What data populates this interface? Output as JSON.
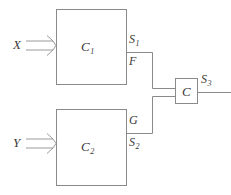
{
  "diagram": {
    "stroke_color": "#8a8a8a",
    "text_color": "#3a3a3a",
    "background": "#ffffff",
    "blocks": [
      {
        "id": "c1",
        "label": "C",
        "subscript": "1"
      },
      {
        "id": "c2",
        "label": "C",
        "subscript": "2"
      },
      {
        "id": "c",
        "label": "C",
        "subscript": ""
      }
    ],
    "inputs": [
      {
        "id": "x",
        "label": "X"
      },
      {
        "id": "y",
        "label": "Y"
      }
    ],
    "signals": [
      {
        "id": "s1",
        "label": "S",
        "subscript": "1"
      },
      {
        "id": "f",
        "label": "F",
        "subscript": ""
      },
      {
        "id": "g",
        "label": "G",
        "subscript": ""
      },
      {
        "id": "s2",
        "label": "S",
        "subscript": "2"
      },
      {
        "id": "s3",
        "label": "S",
        "subscript": "3"
      }
    ]
  }
}
